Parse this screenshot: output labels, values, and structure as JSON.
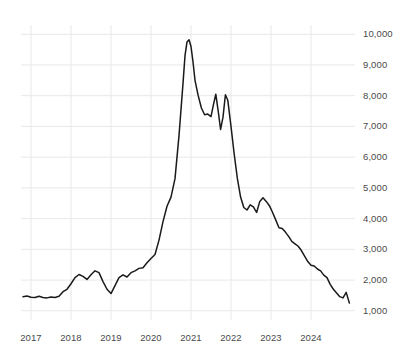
{
  "chart_data": {
    "type": "line",
    "title": "",
    "subtitle": "",
    "xlabel": "",
    "ylabel": "",
    "grid": true,
    "legend": "none",
    "line_color": "#1a1a1a",
    "grid_color": "#e8e8e8",
    "background_color": "#ffffff",
    "text_color": "#4a4a4a",
    "xlim": [
      2016.75,
      2025.1
    ],
    "ylim": [
      700,
      10300
    ],
    "x_tick_labels": [
      "2017",
      "2018",
      "2019",
      "2020",
      "2021",
      "2022",
      "2023",
      "2024"
    ],
    "x_tick_values": [
      2017,
      2018,
      2019,
      2020,
      2021,
      2022,
      2023,
      2024
    ],
    "y_tick_labels": [
      "1,000",
      "2,000",
      "3,000",
      "4,000",
      "5,000",
      "6,000",
      "7,000",
      "8,000",
      "9,000",
      "10,000"
    ],
    "y_tick_values": [
      1000,
      2000,
      3000,
      4000,
      5000,
      6000,
      7000,
      8000,
      9000,
      10000
    ],
    "y_axis_position": "right",
    "series": [
      {
        "name": "value",
        "x": [
          2016.8,
          2016.9,
          2017.0,
          2017.1,
          2017.2,
          2017.3,
          2017.4,
          2017.5,
          2017.6,
          2017.7,
          2017.8,
          2017.9,
          2018.0,
          2018.1,
          2018.2,
          2018.3,
          2018.4,
          2018.5,
          2018.6,
          2018.7,
          2018.8,
          2018.9,
          2019.0,
          2019.1,
          2019.2,
          2019.3,
          2019.4,
          2019.5,
          2019.6,
          2019.7,
          2019.8,
          2019.9,
          2020.0,
          2020.1,
          2020.2,
          2020.3,
          2020.4,
          2020.5,
          2020.6,
          2020.7,
          2020.8,
          2020.85,
          2020.9,
          2020.95,
          2021.0,
          2021.05,
          2021.1,
          2021.18,
          2021.26,
          2021.34,
          2021.42,
          2021.5,
          2021.56,
          2021.62,
          2021.68,
          2021.74,
          2021.8,
          2021.86,
          2021.92,
          2022.0,
          2022.08,
          2022.16,
          2022.24,
          2022.32,
          2022.4,
          2022.48,
          2022.56,
          2022.64,
          2022.72,
          2022.8,
          2022.88,
          2022.96,
          2023.04,
          2023.12,
          2023.2,
          2023.28,
          2023.36,
          2023.44,
          2023.52,
          2023.6,
          2023.68,
          2023.76,
          2023.84,
          2023.92,
          2024.0,
          2024.08,
          2024.16,
          2024.24,
          2024.32,
          2024.4,
          2024.48,
          2024.56,
          2024.64,
          2024.72,
          2024.8,
          2024.88,
          2024.96
        ],
        "values": [
          1460,
          1480,
          1440,
          1430,
          1470,
          1430,
          1420,
          1450,
          1430,
          1470,
          1620,
          1700,
          1880,
          2080,
          2180,
          2120,
          2020,
          2170,
          2300,
          2240,
          1950,
          1700,
          1560,
          1820,
          2080,
          2170,
          2100,
          2240,
          2300,
          2380,
          2400,
          2560,
          2700,
          2830,
          3300,
          3900,
          4400,
          4700,
          5300,
          6700,
          8400,
          9300,
          9750,
          9820,
          9600,
          9100,
          8500,
          8000,
          7600,
          7380,
          7400,
          7320,
          7700,
          8050,
          7500,
          6900,
          7300,
          8030,
          7850,
          7000,
          6100,
          5300,
          4700,
          4360,
          4280,
          4450,
          4380,
          4200,
          4560,
          4680,
          4560,
          4420,
          4200,
          3950,
          3700,
          3680,
          3560,
          3420,
          3260,
          3180,
          3100,
          2960,
          2780,
          2600,
          2480,
          2460,
          2360,
          2300,
          2160,
          2080,
          1860,
          1700,
          1580,
          1460,
          1420,
          1600,
          1250
        ]
      }
    ]
  }
}
